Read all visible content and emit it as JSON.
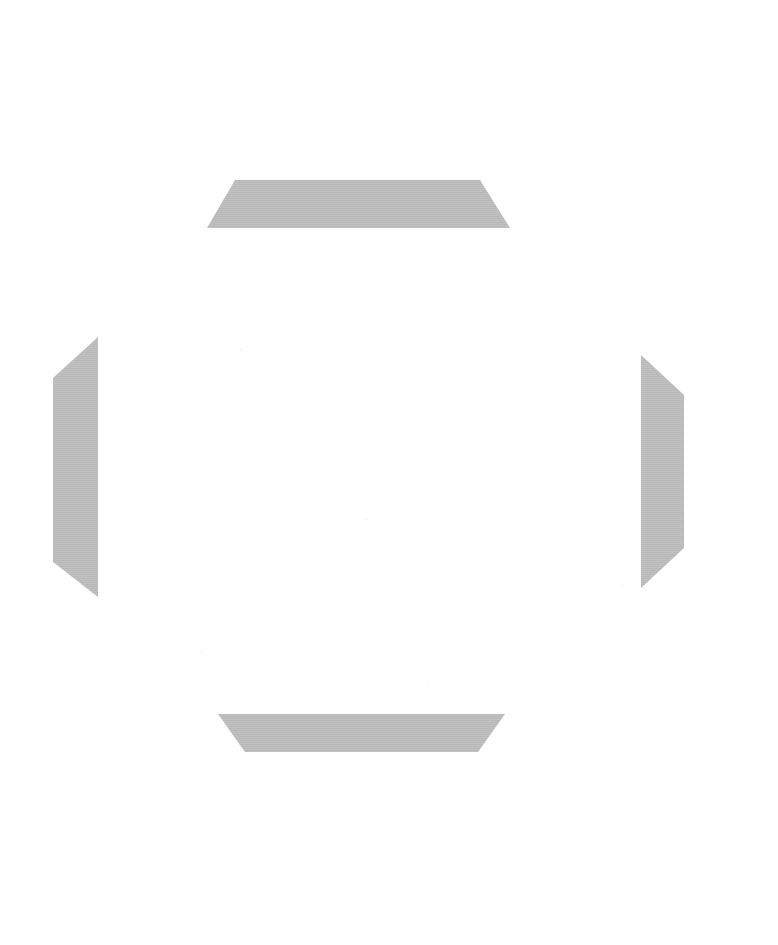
{
  "canvas": {
    "width": 778,
    "height": 945,
    "background_color": "#ffffff",
    "description": "Blank white field with four gray trapezoidal bracket shapes arranged symmetrically, forming an octagonal frame outline around an empty center."
  },
  "palette": {
    "shape_fill": "#b8b8b8",
    "shape_fill_light": "#c2c2c2",
    "background": "#ffffff",
    "noise": "#eeeef2"
  },
  "shapes": {
    "top_bracket": {
      "name": "top-bracket",
      "orientation": "top",
      "fill": "#b8b8b8",
      "points": "235,180 480,180 510,228 207,228"
    },
    "bottom_bracket": {
      "name": "bottom-bracket",
      "orientation": "bottom",
      "fill": "#b8b8b8",
      "points": "218,714 505,714 478,752 245,752"
    },
    "left_bracket": {
      "name": "left-bracket",
      "orientation": "left",
      "fill": "#b8b8b8",
      "points": "98,337 98,597 53,562 53,378"
    },
    "right_bracket": {
      "name": "right-bracket",
      "orientation": "right",
      "fill": "#b8b8b8",
      "points": "641,355 684,395 684,548 641,588"
    }
  },
  "center": {
    "name": "empty-center-region",
    "content": "",
    "note": "no text or controls rendered"
  }
}
